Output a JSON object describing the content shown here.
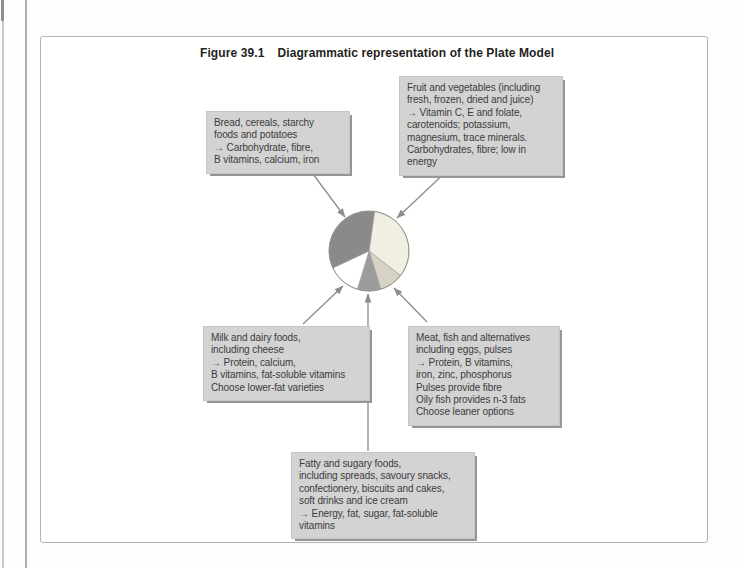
{
  "figure": {
    "label": "Figure 39.1",
    "title": "Diagrammatic representation of the Plate Model"
  },
  "boxes": {
    "bread": {
      "lines": [
        "Bread, cereals, starchy",
        "foods and potatoes",
        "→ Carbohydrate, fibre,",
        "B vitamins, calcium, iron"
      ]
    },
    "fruit": {
      "lines": [
        "Fruit and vegetables (including",
        "fresh, frozen, dried and juice)",
        "→ Vitamin C, E and folate,",
        "carotenoids; potassium,",
        "magnesium, trace minerals.",
        "Carbohydrates, fibre; low in",
        "energy"
      ]
    },
    "milk": {
      "lines": [
        "Milk and dairy foods,",
        "including cheese",
        "→ Protein, calcium,",
        "B vitamins, fat-soluble vitamins",
        "Choose lower-fat varieties"
      ]
    },
    "meat": {
      "lines": [
        "Meat, fish and alternatives",
        "including eggs, pulses",
        "→ Protein, B vitamins,",
        "iron, zinc, phosphorus",
        "Pulses provide fibre",
        "Oily fish provides n-3 fats",
        "Choose leaner options"
      ]
    },
    "fatty": {
      "lines": [
        "Fatty and sugary foods,",
        "including spreads, savoury snacks,",
        "confectionery, biscuits and cakes,",
        "soft drinks and ice cream",
        "→ Energy, fat, sugar, fat-soluble",
        "vitamins"
      ]
    }
  },
  "chart_data": {
    "type": "pie",
    "legend_position": "none",
    "segments": [
      {
        "id": "fruit",
        "label": "Fruit and vegetables",
        "start_deg": 8,
        "end_deg": 128,
        "percent_est": 33,
        "color": "#f1efe2"
      },
      {
        "id": "meat",
        "label": "Meat, fish and alternatives",
        "start_deg": 128,
        "end_deg": 163,
        "percent_est": 10,
        "color": "#d7d3c4"
      },
      {
        "id": "fatty",
        "label": "Fatty and sugary foods",
        "start_deg": 163,
        "end_deg": 197,
        "percent_est": 9,
        "color": "#9c9c9c"
      },
      {
        "id": "milk",
        "label": "Milk and dairy foods",
        "start_deg": 197,
        "end_deg": 245,
        "percent_est": 13,
        "color": "#ffffff"
      },
      {
        "id": "bread",
        "label": "Bread, cereals, starchy foods and potatoes",
        "start_deg": 245,
        "end_deg": 368,
        "percent_est": 34,
        "color": "#8a8a8a"
      }
    ]
  },
  "connections": [
    {
      "from": "bread-cereals-box",
      "to": "pie-segment-bread"
    },
    {
      "from": "fruit-vegetables-box",
      "to": "pie-segment-fruit"
    },
    {
      "from": "milk-dairy-box",
      "to": "pie-segment-milk"
    },
    {
      "from": "fatty-sugary-box",
      "to": "pie-segment-fatty"
    },
    {
      "from": "meat-fish-box",
      "to": "pie-segment-meat"
    }
  ]
}
